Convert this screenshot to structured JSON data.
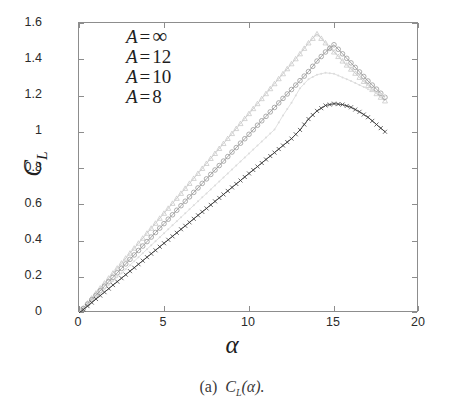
{
  "figure": {
    "caption_prefix": "(a)",
    "caption_body": "C",
    "caption_sub": "L",
    "caption_arg": "(α).",
    "caption_full": "(a) C_L(α)."
  },
  "axes": {
    "ylabel_main": "C",
    "ylabel_sub": "L",
    "xlabel": "α",
    "x_ticks": [
      "0",
      "5",
      "10",
      "15",
      "20"
    ],
    "y_ticks": [
      "0",
      "0.2",
      "0.4",
      "0.6",
      "0.8",
      "1",
      "1.2",
      "1.4",
      "1.6"
    ]
  },
  "legend": {
    "entries": [
      {
        "symbol": "A",
        "eq": "=",
        "value": "∞",
        "marker": "triangle-marker",
        "color": "#c9c9c9"
      },
      {
        "symbol": "A",
        "eq": "=",
        "value": "12",
        "marker": "circle-marker",
        "color": "#9a9a9a"
      },
      {
        "symbol": "A",
        "eq": "=",
        "value": "10",
        "marker": "dot-marker",
        "color": "#dcdcdc"
      },
      {
        "symbol": "A",
        "eq": "=",
        "value": "8",
        "marker": "cross-marker",
        "color": "#3a3a3a"
      }
    ]
  },
  "chart_data": {
    "type": "line",
    "title": "",
    "xlabel": "α",
    "ylabel": "C_L",
    "xlim": [
      0,
      20
    ],
    "ylim": [
      0,
      1.6
    ],
    "xticks": [
      0,
      5,
      10,
      15,
      20
    ],
    "yticks": [
      0,
      0.2,
      0.4,
      0.6,
      0.8,
      1.0,
      1.2,
      1.4,
      1.6
    ],
    "grid": false,
    "legend_position": "upper-left",
    "series": [
      {
        "name": "A = ∞",
        "marker": "triangle",
        "color": "#c9c9c9",
        "x": [
          0,
          0.5,
          1,
          1.5,
          2,
          2.5,
          3,
          3.5,
          4,
          4.5,
          5,
          5.5,
          6,
          6.5,
          7,
          7.5,
          8,
          8.5,
          9,
          9.5,
          10,
          10.5,
          11,
          11.5,
          12,
          12.5,
          13,
          13.5,
          14,
          14.5,
          15,
          15.5,
          16,
          16.5,
          17,
          17.5,
          18
        ],
        "y": [
          0,
          0.055,
          0.11,
          0.165,
          0.22,
          0.275,
          0.33,
          0.385,
          0.44,
          0.495,
          0.55,
          0.605,
          0.66,
          0.715,
          0.77,
          0.825,
          0.88,
          0.935,
          0.99,
          1.045,
          1.1,
          1.155,
          1.21,
          1.265,
          1.32,
          1.375,
          1.43,
          1.49,
          1.54,
          1.49,
          1.44,
          1.39,
          1.345,
          1.3,
          1.255,
          1.21,
          1.17
        ]
      },
      {
        "name": "A = 12",
        "marker": "circle",
        "color": "#9a9a9a",
        "x": [
          0,
          0.5,
          1,
          1.5,
          2,
          2.5,
          3,
          3.5,
          4,
          4.5,
          5,
          5.5,
          6,
          6.5,
          7,
          7.5,
          8,
          8.5,
          9,
          9.5,
          10,
          10.5,
          11,
          11.5,
          12,
          12.5,
          13,
          13.5,
          14,
          14.5,
          15,
          15.5,
          16,
          16.5,
          17,
          17.5,
          18
        ],
        "y": [
          0,
          0.049,
          0.098,
          0.148,
          0.197,
          0.246,
          0.296,
          0.345,
          0.394,
          0.444,
          0.493,
          0.542,
          0.592,
          0.641,
          0.69,
          0.74,
          0.789,
          0.838,
          0.888,
          0.937,
          0.986,
          1.036,
          1.085,
          1.134,
          1.184,
          1.233,
          1.282,
          1.332,
          1.39,
          1.44,
          1.48,
          1.43,
          1.38,
          1.33,
          1.28,
          1.235,
          1.19
        ]
      },
      {
        "name": "A = 10",
        "marker": "dot",
        "color": "#dcdcdc",
        "x": [
          0,
          0.5,
          1,
          1.5,
          2,
          2.5,
          3,
          3.5,
          4,
          4.5,
          5,
          5.5,
          6,
          6.5,
          7,
          7.5,
          8,
          8.5,
          9,
          9.5,
          10,
          10.5,
          11,
          11.5,
          12,
          12.5,
          13,
          13.5,
          14,
          14.5,
          15,
          15.5,
          16,
          16.5,
          17,
          17.5,
          18
        ],
        "y": [
          0,
          0.044,
          0.088,
          0.132,
          0.176,
          0.22,
          0.264,
          0.308,
          0.352,
          0.396,
          0.44,
          0.484,
          0.528,
          0.572,
          0.616,
          0.66,
          0.704,
          0.748,
          0.792,
          0.836,
          0.88,
          0.924,
          0.968,
          1.012,
          1.09,
          1.16,
          1.24,
          1.29,
          1.315,
          1.325,
          1.32,
          1.3,
          1.28,
          1.258,
          1.235,
          1.215,
          1.2
        ]
      },
      {
        "name": "A = 8",
        "marker": "cross",
        "color": "#3a3a3a",
        "x": [
          0,
          0.5,
          1,
          1.5,
          2,
          2.5,
          3,
          3.5,
          4,
          4.5,
          5,
          5.5,
          6,
          6.5,
          7,
          7.5,
          8,
          8.5,
          9,
          9.5,
          10,
          10.5,
          11,
          11.5,
          12,
          12.5,
          13,
          13.5,
          14,
          14.5,
          15,
          15.5,
          16,
          16.5,
          17,
          17.5,
          18
        ],
        "y": [
          0,
          0.038,
          0.077,
          0.115,
          0.154,
          0.192,
          0.231,
          0.269,
          0.308,
          0.346,
          0.385,
          0.423,
          0.462,
          0.5,
          0.539,
          0.577,
          0.616,
          0.654,
          0.693,
          0.731,
          0.77,
          0.808,
          0.847,
          0.885,
          0.924,
          0.962,
          1.01,
          1.07,
          1.115,
          1.145,
          1.155,
          1.15,
          1.135,
          1.11,
          1.08,
          1.04,
          1.0
        ]
      }
    ]
  }
}
